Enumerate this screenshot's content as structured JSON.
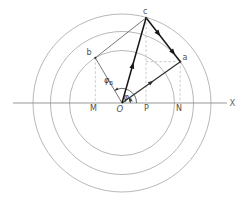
{
  "figure": {
    "canvas": {
      "width": 250,
      "height": 204,
      "background": "#ffffff"
    },
    "colors": {
      "circle": "#a6a6a6",
      "axis": "#8c8c8c",
      "dashed": "#bdbdbd",
      "thin_line": "#565656",
      "medium_line": "#2b2b2b",
      "bold_line": "#161616",
      "label": "#4f4f4f",
      "axis_label": "#6a6a6a",
      "angle_label": "#333333",
      "dot": "#333333"
    },
    "center": {
      "x": 122,
      "y": 103
    },
    "circles": [
      {
        "name": "inner-circle",
        "r": 52.5
      },
      {
        "name": "middle-circle",
        "r": 71.5
      },
      {
        "name": "outer-circle",
        "r": 89
      }
    ],
    "axis": {
      "x1": 13,
      "x2": 227,
      "y": 103,
      "label": "X",
      "label_x": 229.5,
      "label_y": 106
    },
    "points": {
      "O": {
        "x": 122,
        "y": 103
      },
      "a": {
        "x": 180.3,
        "y": 61.7
      },
      "b": {
        "x": 95.3,
        "y": 57.8
      },
      "c": {
        "x": 146.1,
        "y": 17.8
      },
      "M": {
        "x": 95.3,
        "y": 103
      },
      "P": {
        "x": 146,
        "y": 103
      },
      "N": {
        "x": 180,
        "y": 103
      }
    },
    "lines": [
      {
        "name": "segment-O-b",
        "from": "O",
        "to": "b",
        "style": "thin",
        "arrows": []
      },
      {
        "name": "segment-b-c",
        "from": "b",
        "to": "c",
        "style": "thin",
        "arrows": []
      },
      {
        "name": "vector-O-a",
        "from": "O",
        "to": "a",
        "style": "medium",
        "arrows": [
          0.54
        ]
      },
      {
        "name": "vector-O-c",
        "from": "O",
        "to": "c",
        "style": "bold",
        "arrows": [
          0.48
        ]
      },
      {
        "name": "vector-c-a",
        "from": "c",
        "to": "a",
        "style": "bold",
        "arrows": [
          0.42,
          0.85
        ]
      }
    ],
    "dashed_lines": [
      {
        "name": "projection-b-M",
        "from": "b",
        "to": "M"
      },
      {
        "name": "projection-c-P",
        "from": "c",
        "to": "P"
      },
      {
        "name": "projection-a-N",
        "from": "a",
        "to": "N"
      },
      {
        "name": "horizontal-guide-a",
        "x1": 146,
        "y1": 61.7,
        "x2": 177.5,
        "y2": 61.7
      }
    ],
    "angle_arcs": [
      {
        "name": "angle-phi-B",
        "text": "φ",
        "sub": "B",
        "from_deg": 0,
        "to_deg": 120.4,
        "radius": 14.5,
        "label_x": 104,
        "label_y": 83
      },
      {
        "name": "angle-phi-A",
        "text": "φ",
        "sub": "A",
        "from_deg": 0,
        "to_deg": 35.3,
        "radius": 8.5,
        "label_x": 123.5,
        "label_y": 100
      }
    ],
    "dots": [
      "a",
      "b",
      "c"
    ],
    "point_labels": [
      {
        "name": "label-O",
        "text": "O",
        "x": 116.5,
        "y": 112,
        "italic": true
      },
      {
        "name": "label-M",
        "text": "M",
        "x": 90,
        "y": 111
      },
      {
        "name": "label-P",
        "text": "P",
        "x": 144,
        "y": 111
      },
      {
        "name": "label-N",
        "text": "N",
        "x": 176,
        "y": 111
      },
      {
        "name": "label-b",
        "text": "b",
        "x": 86.5,
        "y": 55
      },
      {
        "name": "label-c",
        "text": "c",
        "x": 143,
        "y": 14
      },
      {
        "name": "label-a",
        "text": "a",
        "x": 182.5,
        "y": 60
      }
    ]
  }
}
